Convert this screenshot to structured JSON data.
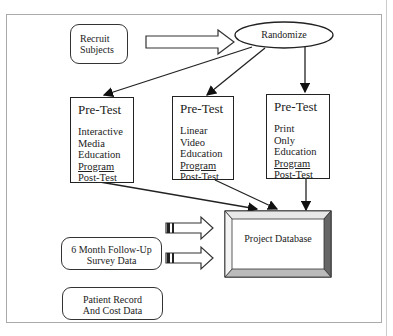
{
  "diagram": {
    "recruit": {
      "lines": [
        "Recruit",
        "Subjects"
      ]
    },
    "randomize": {
      "label": "Randomize"
    },
    "pretest_boxes": [
      {
        "title": "Pre-Test",
        "lines": [
          "Interactive",
          "Media",
          "Education",
          "Program",
          "Post-Test"
        ],
        "underlined": "Program"
      },
      {
        "title": "Pre-Test",
        "lines": [
          "Linear",
          "Video",
          "Education",
          "Program",
          "Post-Test"
        ],
        "underlined": "Program"
      },
      {
        "title": "Pre-Test",
        "lines": [
          "Print",
          "Only",
          "Education",
          "Program",
          "Post-Test"
        ],
        "underlined": "Program"
      }
    ],
    "followup": {
      "lines": [
        "6 Month Follow-Up",
        "Survey Data"
      ]
    },
    "patient": {
      "lines": [
        "Patient Record",
        "And Cost Data"
      ]
    },
    "database": {
      "label": "Project Database"
    }
  }
}
